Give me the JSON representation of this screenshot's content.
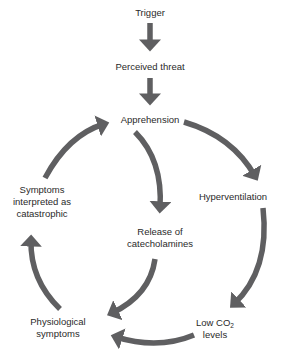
{
  "diagram": {
    "title": "",
    "arrow_color": "#5f5f61",
    "text_color": "#2a2a2a",
    "nodes": {
      "trigger": "Trigger",
      "perceived_threat": "Perceived threat",
      "apprehension": "Apprehension",
      "hyperventilation": "Hyperventilation",
      "low_co2_line1_prefix": "Low CO",
      "low_co2_subscript": "2",
      "low_co2_line2": "levels",
      "physiological_line1": "Physiological",
      "physiological_line2": "symptoms",
      "symptoms_line1": "Symptoms",
      "symptoms_line2": "interpreted as",
      "symptoms_line3": "catastrophic",
      "release_line1": "Release of",
      "release_line2": "catecholamines"
    },
    "edges": [
      {
        "from": "Trigger",
        "to": "Perceived threat"
      },
      {
        "from": "Perceived threat",
        "to": "Apprehension"
      },
      {
        "from": "Apprehension",
        "to": "Hyperventilation"
      },
      {
        "from": "Hyperventilation",
        "to": "Low CO2 levels"
      },
      {
        "from": "Low CO2 levels",
        "to": "Physiological symptoms"
      },
      {
        "from": "Apprehension",
        "to": "Release of catecholamines"
      },
      {
        "from": "Release of catecholamines",
        "to": "Physiological symptoms"
      },
      {
        "from": "Physiological symptoms",
        "to": "Symptoms interpreted as catastrophic"
      },
      {
        "from": "Symptoms interpreted as catastrophic",
        "to": "Apprehension"
      }
    ]
  }
}
